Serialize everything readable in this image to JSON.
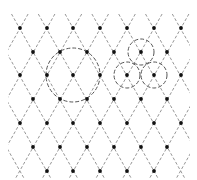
{
  "diagram": {
    "title": "",
    "width": 196,
    "height": 180,
    "colors": {
      "background": "#ffffff",
      "line": "#8a8a8a",
      "dot": "#111111",
      "circle": "#555555"
    },
    "lattice": {
      "dx": 26.8,
      "dy": 23.7,
      "x0": 20,
      "y0": 28,
      "rows": [
        {
          "y": 28,
          "xs": [
            20,
            47,
            73,
            100,
            127,
            154,
            181
          ]
        },
        {
          "y": 52,
          "xs": [
            33,
            60,
            87,
            114,
            141,
            167
          ]
        },
        {
          "y": 75,
          "xs": [
            20,
            47,
            73,
            100,
            127,
            154,
            181
          ]
        },
        {
          "y": 99,
          "xs": [
            33,
            60,
            87,
            114,
            141,
            167
          ]
        },
        {
          "y": 123,
          "xs": [
            20,
            47,
            73,
            100,
            127,
            154,
            181
          ]
        },
        {
          "y": 147,
          "xs": [
            33,
            60,
            87,
            114,
            141,
            167
          ]
        },
        {
          "y": 171,
          "xs": [
            47,
            73,
            100,
            127,
            154
          ]
        }
      ]
    },
    "circles": [
      {
        "cx": 73,
        "cy": 75,
        "r": 27,
        "label": "large-circle"
      },
      {
        "cx": 141,
        "cy": 52,
        "r": 13,
        "label": "small-circle-top"
      },
      {
        "cx": 127,
        "cy": 75,
        "r": 13,
        "label": "small-circle-left"
      },
      {
        "cx": 154,
        "cy": 75,
        "r": 13,
        "label": "small-circle-right"
      }
    ]
  }
}
